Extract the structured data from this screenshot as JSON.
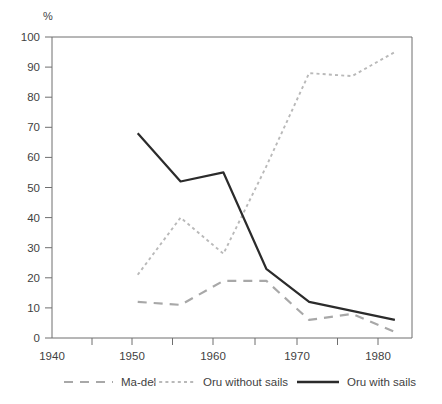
{
  "chart_data": {
    "type": "line",
    "title": "",
    "xlabel": "",
    "ylabel": "%",
    "ylim": [
      0,
      100
    ],
    "xlim": [
      1940,
      1982
    ],
    "grid": false,
    "legend_position": "bottom",
    "x_ticks": [
      1940,
      1950,
      1960,
      1970,
      1980
    ],
    "x_minor_ticks": [
      1945,
      1955,
      1965,
      1975
    ],
    "y_ticks": [
      0,
      10,
      20,
      30,
      40,
      50,
      60,
      70,
      80,
      90,
      100
    ],
    "x": [
      1950,
      1955,
      1960,
      1965,
      1970,
      1975,
      1980
    ],
    "series": [
      {
        "name": "Ma-del",
        "style": "dashed",
        "color": "#a8a8a8",
        "values": [
          12,
          11,
          19,
          19,
          6,
          8,
          2
        ]
      },
      {
        "name": "Oru without sails",
        "style": "dotted",
        "color": "#b9b9b9",
        "values": [
          21,
          40,
          28,
          57,
          88,
          87,
          95
        ]
      },
      {
        "name": "Oru with sails",
        "style": "solid",
        "color": "#2b2b2b",
        "values": [
          68,
          52,
          55,
          23,
          12,
          9,
          6
        ]
      }
    ]
  },
  "axes": {
    "y_unit": "%",
    "y_tick_labels": [
      "100",
      "90",
      "80",
      "70",
      "60",
      "50",
      "40",
      "30",
      "20",
      "10",
      "0"
    ],
    "x_tick_labels": [
      "1940",
      "1950",
      "1960",
      "1970",
      "1980"
    ]
  },
  "legend": {
    "items": [
      {
        "label": "Ma-del"
      },
      {
        "label": "Oru without sails"
      },
      {
        "label": "Oru with sails"
      }
    ]
  },
  "colors": {
    "axis": "#6f6f6f",
    "text": "#3f3f3f",
    "solid_series": "#2b2b2b",
    "dashed_series": "#a8a8a8",
    "dotted_series": "#b9b9b9"
  }
}
